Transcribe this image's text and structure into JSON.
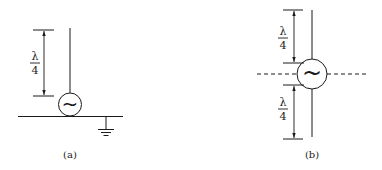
{
  "figure": {
    "panel_a": {
      "caption": "(a)",
      "dimension_label": {
        "numerator": "λ",
        "denominator": "4"
      },
      "source_symbol": "~",
      "description": "Quarter-wave monopole antenna fed at ground plane with grounded reference"
    },
    "panel_b": {
      "caption": "(b)",
      "upper_dimension_label": {
        "numerator": "λ",
        "denominator": "4"
      },
      "lower_dimension_label": {
        "numerator": "λ",
        "denominator": "4"
      },
      "source_symbol": "~",
      "description": "Half-wave dipole antenna fed at center"
    },
    "colors": {
      "line": "#1a1a1a",
      "background": "#ffffff"
    }
  }
}
